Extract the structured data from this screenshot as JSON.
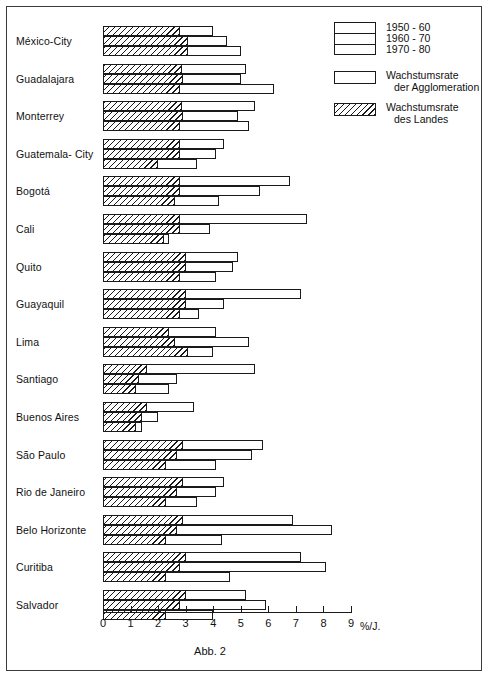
{
  "caption": "Abb. 2",
  "axis": {
    "unit": "%/J.",
    "ticks": [
      "0",
      "1",
      "2",
      "3",
      "4",
      "5",
      "6",
      "7",
      "8",
      "9"
    ],
    "min": 0,
    "max": 9
  },
  "legend": {
    "periods": [
      "1950 - 60",
      "1960 - 70",
      "1970 - 80"
    ],
    "entries": [
      {
        "line1": "Wachstumsrate",
        "line2": "der  Agglomeration",
        "pattern": "open"
      },
      {
        "line1": "Wachstumsrate",
        "line2": "des  Landes",
        "pattern": "hatched"
      }
    ]
  },
  "chart_data": {
    "type": "bar",
    "orientation": "horizontal",
    "title": "Abb. 2",
    "xlabel": "%/J.",
    "ylabel": "",
    "xlim": [
      0,
      9
    ],
    "grid": false,
    "legend_position": "top-right",
    "categories": [
      "México-City",
      "Guadalajara",
      "Monterrey",
      "Guatemala- City",
      "Bogotá",
      "Cali",
      "Quito",
      "Guayaquil",
      "Lima",
      "Santiago",
      "Buenos Aires",
      "São Paulo",
      "Rio de Janeiro",
      "Belo Horizonte",
      "Curitiba",
      "Salvador"
    ],
    "periods": [
      "1950 - 60",
      "1960 - 70",
      "1970 - 80"
    ],
    "series": [
      {
        "name": "Wachstumsrate der Agglomeration",
        "values": [
          [
            4.0,
            4.5,
            5.0
          ],
          [
            5.2,
            5.0,
            6.2
          ],
          [
            5.5,
            4.9,
            5.3
          ],
          [
            4.4,
            4.1,
            3.4
          ],
          [
            6.8,
            5.7,
            4.2
          ],
          [
            7.4,
            3.9,
            2.4
          ],
          [
            4.9,
            4.7,
            4.1
          ],
          [
            7.2,
            4.4,
            3.5
          ],
          [
            4.1,
            5.3,
            4.0
          ],
          [
            5.5,
            2.7,
            2.4
          ],
          [
            3.3,
            2.0,
            1.4
          ],
          [
            5.8,
            5.4,
            4.1
          ],
          [
            4.4,
            4.1,
            3.4
          ],
          [
            6.9,
            8.3,
            4.3
          ],
          [
            7.2,
            8.1,
            4.6
          ],
          [
            5.2,
            5.9,
            4.0
          ]
        ]
      },
      {
        "name": "Wachstumsrate des Landes",
        "values": [
          [
            2.8,
            3.1,
            3.1
          ],
          [
            2.85,
            2.9,
            2.8
          ],
          [
            2.85,
            2.9,
            2.8
          ],
          [
            2.8,
            2.8,
            2.0
          ],
          [
            2.8,
            2.8,
            2.6
          ],
          [
            2.8,
            2.8,
            2.2
          ],
          [
            3.0,
            3.0,
            2.8
          ],
          [
            3.0,
            3.0,
            2.8
          ],
          [
            2.4,
            2.6,
            3.1
          ],
          [
            1.6,
            1.3,
            1.2
          ],
          [
            1.6,
            1.4,
            1.2
          ],
          [
            2.9,
            2.7,
            2.3
          ],
          [
            2.9,
            2.7,
            2.3
          ],
          [
            2.9,
            2.7,
            2.3
          ],
          [
            3.0,
            2.8,
            2.3
          ],
          [
            3.0,
            2.8,
            2.3
          ]
        ]
      }
    ]
  }
}
